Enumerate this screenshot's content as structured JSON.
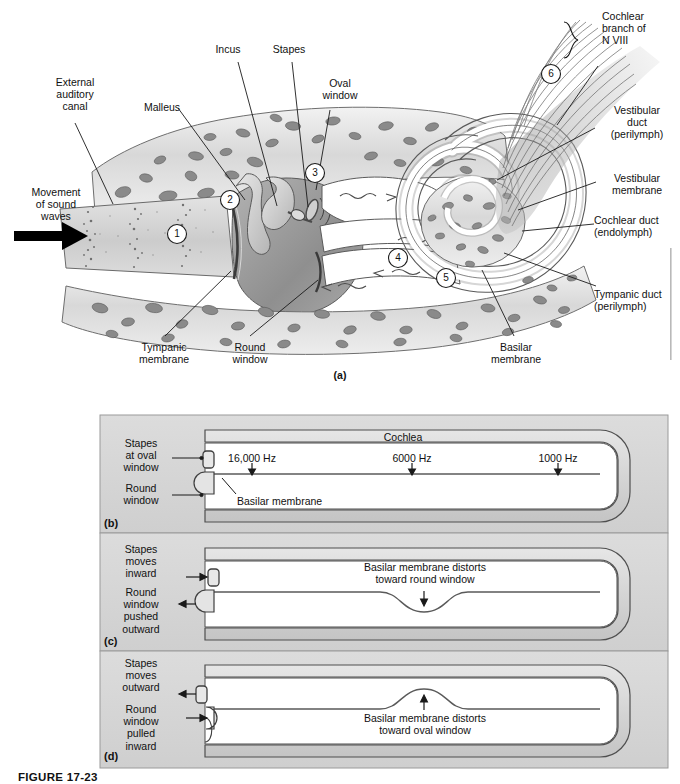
{
  "figure": {
    "caption": "FIGURE 17-23",
    "panel_a_letter": "(a)",
    "panel_b_letter": "(b)",
    "panel_c_letter": "(c)",
    "panel_d_letter": "(d)"
  },
  "panel_a": {
    "labels": {
      "external_auditory_canal": "External\nauditory\ncanal",
      "malleus": "Malleus",
      "incus": "Incus",
      "stapes": "Stapes",
      "oval_window": "Oval\nwindow",
      "movement_of_sound_waves": "Movement\nof sound\nwaves",
      "tympanic_membrane": "Tympanic\nmembrane",
      "round_window": "Round\nwindow",
      "basilar_membrane": "Basilar\nmembrane",
      "cochlear_branch": "Cochlear\nbranch of\nN VIII",
      "vestibular_duct": "Vestibular\nduct\n(perilymph)",
      "vestibular_membrane": "Vestibular\nmembrane",
      "cochlear_duct": "Cochlear duct\n(endolymph)",
      "tympanic_duct": "Tympanic duct\n(perilymph)"
    },
    "step_numbers": [
      "1",
      "2",
      "3",
      "4",
      "5",
      "6"
    ]
  },
  "panel_b": {
    "title": "Cochlea",
    "stapes_label": "Stapes\nat oval\nwindow",
    "round_window_label": "Round\nwindow",
    "basilar_membrane_label": "Basilar membrane",
    "frequencies": [
      {
        "label": "16,000 Hz",
        "x": 252
      },
      {
        "label": "6000 Hz",
        "x": 412
      },
      {
        "label": "1000 Hz",
        "x": 558
      }
    ]
  },
  "panel_c": {
    "stapes_label": "Stapes\nmoves\ninward",
    "round_window_label": "Round\nwindow\npushed\noutward",
    "distortion_label": "Basilar membrane distorts\ntoward round window"
  },
  "panel_d": {
    "stapes_label": "Stapes\nmoves\noutward",
    "round_window_label": "Round\nwindow\npulled\ninward",
    "distortion_label": "Basilar membrane distorts\ntoward oval window"
  },
  "colors": {
    "panel_background": "#d4d4d4",
    "bone_fill": "#c9c9c9",
    "duct_fill": "#ffffff",
    "line": "#4a4a4a",
    "text": "#111111"
  }
}
